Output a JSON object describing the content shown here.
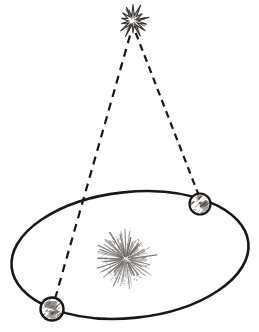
{
  "diagram": {
    "background_color": "#ffffff",
    "width": 259,
    "height": 332,
    "ink_color": "#1a1614",
    "sun_color": "#6b6560",
    "star_color": "#3a3431",
    "globe_land_color": "#7d7671"
  },
  "star": {
    "label": "distant star",
    "icon": "star-burst-icon",
    "center_x": 133,
    "center_y": 21,
    "radius": 16,
    "ray_count": 14,
    "color": "#3a3431"
  },
  "sun": {
    "label": "Sun",
    "icon": "sun-burst-icon",
    "center_x": 126,
    "center_y": 259,
    "radius": 30,
    "ray_count": 72,
    "color": "#6b6560"
  },
  "orbit": {
    "label": "Earth's orbit",
    "center_x": 130,
    "center_y": 255,
    "radius_x": 119,
    "radius_y": 63,
    "rotation_deg": -6,
    "stroke_width": 2.6,
    "color": "#1a1614"
  },
  "earth_positions": [
    {
      "id": "earth-position-right",
      "label": "Earth (first observation)",
      "center_x": 200,
      "center_y": 204,
      "radius": 10.5,
      "outline_width": 2.2
    },
    {
      "id": "earth-position-left",
      "label": "Earth (six months later)",
      "center_x": 52,
      "center_y": 309,
      "radius": 11.5,
      "outline_width": 2.4
    }
  ],
  "sight_lines": [
    {
      "id": "sight-line-right",
      "label": "line of sight from Earth (first observation) to star",
      "from_x": 199,
      "from_y": 196,
      "to_x": 135,
      "to_y": 31,
      "dash": "7 5",
      "stroke_width": 2.2
    },
    {
      "id": "sight-line-left",
      "label": "line of sight from Earth (six months later) to star",
      "from_x": 55,
      "from_y": 299,
      "to_x": 131,
      "to_y": 32,
      "dash": "8 6",
      "stroke_width": 2.2
    }
  ]
}
